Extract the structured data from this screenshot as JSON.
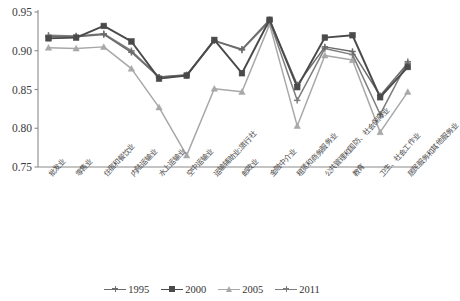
{
  "chart_data": {
    "type": "line",
    "title": "",
    "xlabel": "",
    "ylabel": "",
    "ylim": [
      0.75,
      0.95
    ],
    "yticks": [
      0.75,
      0.8,
      0.85,
      0.9,
      0.95
    ],
    "ytick_labels": [
      "0.75",
      "0.80",
      "0.85",
      "0.90",
      "0.95"
    ],
    "grid": false,
    "legend_position": "bottom",
    "categories": [
      "批发业",
      "零售业",
      "住宿和餐饮业",
      "内陆运输业",
      "水上运输业",
      "空中运输业",
      "运输辅助业;旅行社",
      "邮政业",
      "金融中介业",
      "租赁和商务服务业",
      "公共管理和国防、社会保障业",
      "教育",
      "卫生、社会工作业",
      "居民服务和其他服务业"
    ],
    "series": [
      {
        "name": "1995",
        "color": "#6b6b6b",
        "marker": "plus",
        "values": [
          0.918,
          0.918,
          0.921,
          0.898,
          0.866,
          0.869,
          0.913,
          0.902,
          0.94,
          0.856,
          0.905,
          0.899,
          0.842,
          0.884
        ]
      },
      {
        "name": "2000",
        "color": "#4a4a4a",
        "marker": "square",
        "values": [
          0.916,
          0.917,
          0.932,
          0.912,
          0.864,
          0.868,
          0.914,
          0.871,
          0.94,
          0.853,
          0.917,
          0.92,
          0.84,
          0.879
        ]
      },
      {
        "name": "2005",
        "color": "#a8a8a8",
        "marker": "triangle",
        "values": [
          0.904,
          0.903,
          0.905,
          0.877,
          0.827,
          0.765,
          0.851,
          0.847,
          0.934,
          0.803,
          0.894,
          0.888,
          0.795,
          0.847
        ]
      },
      {
        "name": "2011",
        "color": "#7d7d7d",
        "marker": "plus",
        "values": [
          0.92,
          0.919,
          0.922,
          0.9,
          0.866,
          0.868,
          0.913,
          0.901,
          0.938,
          0.836,
          0.903,
          0.895,
          0.818,
          0.886
        ]
      }
    ]
  },
  "legend": {
    "items": [
      {
        "label": "1995"
      },
      {
        "label": "2000"
      },
      {
        "label": "2005"
      },
      {
        "label": "2011"
      }
    ]
  }
}
